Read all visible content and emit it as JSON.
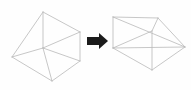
{
  "diagram": {
    "background_color": "#fefefe",
    "stroke_color": "#b9b9b9",
    "stroke_color_dark": "#8e8e8e",
    "arrow_color": "#1b1b1b",
    "watermark_color": "#f2f2f2",
    "arrow": {
      "name": "transformation-arrow",
      "direction": "right",
      "label": ""
    },
    "left_shape": {
      "name": "triangular-prism-upright",
      "label": "",
      "type": "wireframe triangular prism",
      "vertices": [
        {
          "id": "A",
          "x": 12,
          "y": 57
        },
        {
          "id": "B",
          "x": 43,
          "y": 12
        },
        {
          "id": "C",
          "x": 80,
          "y": 32
        },
        {
          "id": "D",
          "x": 43,
          "y": 48
        },
        {
          "id": "E",
          "x": 52,
          "y": 81
        },
        {
          "id": "F",
          "x": 80,
          "y": 61
        }
      ],
      "edges": [
        [
          "A",
          "B"
        ],
        [
          "B",
          "C"
        ],
        [
          "C",
          "F"
        ],
        [
          "F",
          "E"
        ],
        [
          "E",
          "A"
        ],
        [
          "A",
          "D"
        ],
        [
          "D",
          "B"
        ],
        [
          "D",
          "C"
        ],
        [
          "D",
          "E"
        ],
        [
          "D",
          "F"
        ]
      ]
    },
    "right_shape": {
      "name": "triangular-prism-reclined",
      "label": "",
      "type": "wireframe triangular prism",
      "vertices": [
        {
          "id": "P",
          "x": 113,
          "y": 17
        },
        {
          "id": "Q",
          "x": 158,
          "y": 18
        },
        {
          "id": "R",
          "x": 113,
          "y": 48
        },
        {
          "id": "S",
          "x": 152,
          "y": 70
        },
        {
          "id": "T",
          "x": 185,
          "y": 47
        },
        {
          "id": "U",
          "x": 152,
          "y": 31
        }
      ],
      "edges": [
        [
          "P",
          "Q"
        ],
        [
          "P",
          "R"
        ],
        [
          "R",
          "S"
        ],
        [
          "S",
          "T"
        ],
        [
          "T",
          "Q"
        ],
        [
          "R",
          "T"
        ],
        [
          "P",
          "T"
        ],
        [
          "U",
          "S"
        ],
        [
          "U",
          "R"
        ],
        [
          "U",
          "Q"
        ]
      ]
    },
    "watermarks": {
      "top": "",
      "middle": "",
      "bottom": "",
      "right_middle": ""
    }
  }
}
